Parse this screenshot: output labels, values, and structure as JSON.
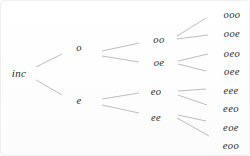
{
  "diagram": {
    "type": "tree",
    "orientation": "left-to-right",
    "levels": 4
  },
  "colors": {
    "background": "#ffffff",
    "text": "#2a2a2a",
    "edge": "#b5b5b5"
  },
  "tree": {
    "root_id": "inc",
    "nodes": [
      {
        "id": "inc",
        "label": "inc",
        "level": 0
      },
      {
        "id": "o",
        "label": "o",
        "level": 1
      },
      {
        "id": "e",
        "label": "e",
        "level": 1
      },
      {
        "id": "oo",
        "label": "oo",
        "level": 2
      },
      {
        "id": "oe",
        "label": "oe",
        "level": 2
      },
      {
        "id": "eo",
        "label": "eo",
        "level": 2
      },
      {
        "id": "ee",
        "label": "ee",
        "level": 2
      },
      {
        "id": "ooo",
        "label": "ooo",
        "level": 3
      },
      {
        "id": "ooe",
        "label": "ooe",
        "level": 3
      },
      {
        "id": "oeo",
        "label": "oeo",
        "level": 3
      },
      {
        "id": "oee",
        "label": "oee",
        "level": 3
      },
      {
        "id": "eee",
        "label": "eee",
        "level": 3
      },
      {
        "id": "eeo",
        "label": "eeo",
        "level": 3
      },
      {
        "id": "eoe",
        "label": "eoe",
        "level": 3
      },
      {
        "id": "eoo",
        "label": "eoo",
        "level": 3
      }
    ],
    "edges": [
      [
        "inc",
        "o"
      ],
      [
        "inc",
        "e"
      ],
      [
        "o",
        "oo"
      ],
      [
        "o",
        "oe"
      ],
      [
        "e",
        "eo"
      ],
      [
        "e",
        "ee"
      ],
      [
        "oo",
        "ooo"
      ],
      [
        "oo",
        "ooe"
      ],
      [
        "oe",
        "oeo"
      ],
      [
        "oe",
        "oee"
      ],
      [
        "eo",
        "eee"
      ],
      [
        "eo",
        "eeo"
      ],
      [
        "ee",
        "eoe"
      ],
      [
        "ee",
        "eoo"
      ]
    ],
    "leaf_order_top_to_bottom": [
      "ooo",
      "ooe",
      "oeo",
      "oee",
      "eee",
      "eeo",
      "eoe",
      "eoo"
    ]
  }
}
